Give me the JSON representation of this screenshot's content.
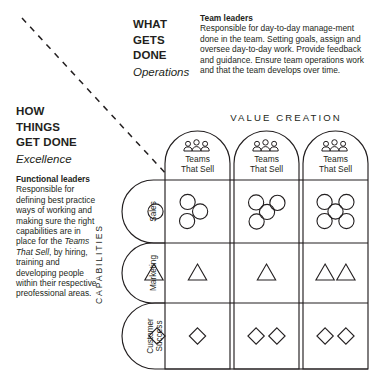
{
  "axes": {
    "vertical_axis": {
      "title": "WHAT\nGETS\nDONE",
      "subtitle": "Operations",
      "description_heading": "Team leaders",
      "description": "Responsible for day-to-day manage-ment done in the team. Setting goals, assign and oversee day-to-day work. Provide feedback and guidance. Ensure team operations work and that the team develops over time."
    },
    "horizontal_axis": {
      "title": "HOW\nTHINGS\nGET DONE",
      "subtitle": "Excellence",
      "description_heading": "Functional leaders",
      "description_part1": "Responsible for defining best practice ways of working and making sure the right capabilities are in place for the ",
      "description_emphasis": "Teams That Sell",
      "description_part2": ", by hiring, training and developing people within their respective preofessional areas."
    }
  },
  "matrix": {
    "column_axis_label": "VALUE CREATION",
    "row_axis_label": "CAPABILITIES",
    "columns": [
      {
        "label": "Teams That Sell",
        "icon": "people-group-icon"
      },
      {
        "label": "Teams That Sell",
        "icon": "people-group-icon"
      },
      {
        "label": "Teams That Sell",
        "icon": "people-group-icon"
      }
    ],
    "rows": [
      {
        "label": "Sales",
        "shape": "circle",
        "counts": [
          3,
          4,
          5
        ]
      },
      {
        "label": "Marketing",
        "shape": "triangle",
        "counts": [
          1,
          1,
          2
        ]
      },
      {
        "label": "Customer Success",
        "shape": "diamond",
        "counts": [
          1,
          2,
          2
        ]
      }
    ]
  },
  "style": {
    "stroke": "#231f20",
    "text": "#231f20",
    "background": "#ffffff"
  }
}
